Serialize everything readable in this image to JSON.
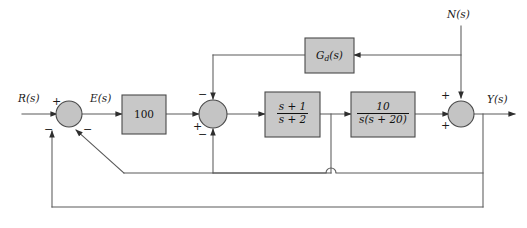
{
  "diagram": {
    "type": "control-block-diagram",
    "colors": {
      "block_fill": "#c8c8c8",
      "block_stroke": "#4a4a4a",
      "wire": "#5a5a5a",
      "background": "#ffffff"
    }
  },
  "signals": {
    "input": "R(s)",
    "error": "E(s)",
    "noise": "N(s)",
    "output": "Y(s)"
  },
  "blocks": {
    "gain": {
      "label": "100",
      "name": "gain-block"
    },
    "lead": {
      "numerator": "s + 1",
      "denominator": "s + 2",
      "name": "lead-compensator-block"
    },
    "plant": {
      "numerator": "10",
      "denominator": "s(s + 20)",
      "name": "plant-block"
    },
    "feedforward": {
      "label_main": "G",
      "label_sub": "d",
      "label_arg": "(s)",
      "name": "disturbance-compensator-block"
    }
  },
  "summers": {
    "summer1": {
      "name": "summing-junction-1",
      "signs": {
        "left": "+",
        "bottom_left": "−",
        "bottom_right": "−"
      }
    },
    "summer2": {
      "name": "summing-junction-2",
      "signs": {
        "top": "−",
        "left": "+",
        "bottom": "−"
      }
    },
    "summer3": {
      "name": "summing-junction-3",
      "signs": {
        "top": "+",
        "bottom_left": "+"
      }
    }
  }
}
